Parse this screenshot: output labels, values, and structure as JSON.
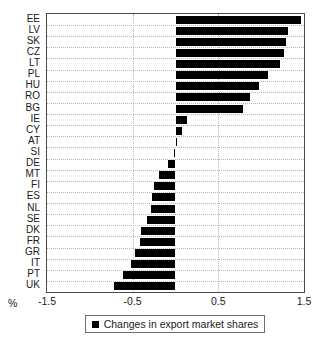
{
  "chart_data": {
    "type": "bar",
    "orientation": "horizontal",
    "title": "",
    "xlabel": "%",
    "ylabel": "",
    "xlim": [
      -1.5,
      1.5
    ],
    "xticks": [
      -1.5,
      -0.5,
      0.5,
      1.5
    ],
    "xtick_labels": [
      "-1.5",
      "-0.5",
      "0.5",
      "1.5"
    ],
    "grid": true,
    "grid_style": "dotted",
    "legend_position": "bottom",
    "bar_color": "#000000",
    "categories": [
      "EE",
      "LV",
      "SK",
      "CZ",
      "LT",
      "PL",
      "HU",
      "RO",
      "BG",
      "IE",
      "CY",
      "AT",
      "SI",
      "DE",
      "MT",
      "FI",
      "ES",
      "NL",
      "SE",
      "DK",
      "FR",
      "GR",
      "IT",
      "PT",
      "UK"
    ],
    "values": [
      1.46,
      1.31,
      1.29,
      1.27,
      1.22,
      1.08,
      0.97,
      0.87,
      0.79,
      0.14,
      0.08,
      0.01,
      -0.02,
      -0.09,
      -0.19,
      -0.25,
      -0.27,
      -0.29,
      -0.33,
      -0.4,
      -0.41,
      -0.47,
      -0.52,
      -0.61,
      -0.72
    ],
    "series": [
      {
        "name": "Changes in export market shares",
        "values": [
          1.46,
          1.31,
          1.29,
          1.27,
          1.22,
          1.08,
          0.97,
          0.87,
          0.79,
          0.14,
          0.08,
          0.01,
          -0.02,
          -0.09,
          -0.19,
          -0.25,
          -0.27,
          -0.29,
          -0.33,
          -0.4,
          -0.41,
          -0.47,
          -0.52,
          -0.61,
          -0.72
        ]
      }
    ],
    "legend": [
      "Changes in export market shares"
    ]
  },
  "axis": {
    "percent_label": "%"
  },
  "legend": {
    "label": "Changes in export market shares"
  }
}
